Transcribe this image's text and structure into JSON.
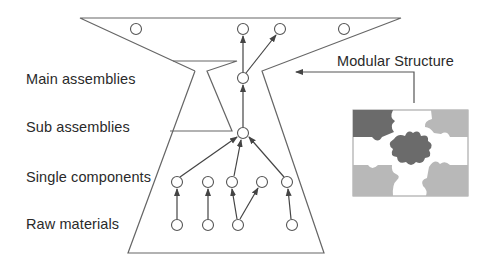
{
  "title": "Modular Structure",
  "levels": [
    {
      "label": "Main assemblies"
    },
    {
      "label": "Sub assemblies"
    },
    {
      "label": "Single components"
    },
    {
      "label": "Raw materials"
    }
  ],
  "callout": {
    "label": "Modular Structure"
  },
  "colors": {
    "line": "#555555",
    "puzzle_dark": "#6b6b6b",
    "puzzle_light": "#b8b8b8",
    "puzzle_white": "#ffffff",
    "text": "#2a2a2a"
  },
  "nodes": {
    "top_row": [
      136,
      242,
      280,
      344
    ],
    "main": [
      243
    ],
    "sub": [
      243
    ],
    "single_components": [
      177,
      208,
      232,
      262,
      287
    ],
    "raw_materials": [
      177,
      208,
      238,
      292
    ]
  }
}
